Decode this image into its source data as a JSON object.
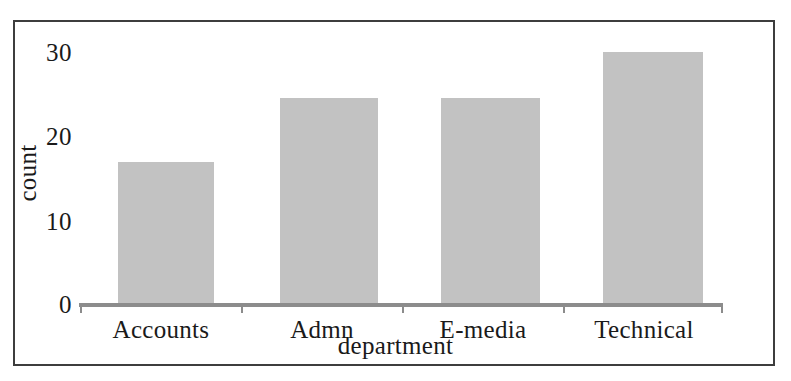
{
  "figure": {
    "background_color": "#ffffff",
    "frame_color": "#3d3d3d",
    "axis_color": "#8c8c8c"
  },
  "chart_data": {
    "type": "bar",
    "title": "",
    "subtitle": "",
    "xlabel": "department",
    "ylabel": "count",
    "categories": [
      "Accounts",
      "Admn",
      "E-media",
      "Technical"
    ],
    "values": [
      17,
      24.5,
      24.5,
      30
    ],
    "ylim": [
      0,
      31
    ],
    "yticks": [
      0,
      10,
      20,
      30
    ],
    "ytick_labels": [
      "0",
      "10",
      "20",
      "30"
    ],
    "xtick_labels": [
      "Accounts",
      "Admn",
      "E-media",
      "Technical"
    ],
    "grid": false,
    "legend": false,
    "legend_position": "none",
    "bar_color": "#c2c2c2",
    "annotations": []
  }
}
